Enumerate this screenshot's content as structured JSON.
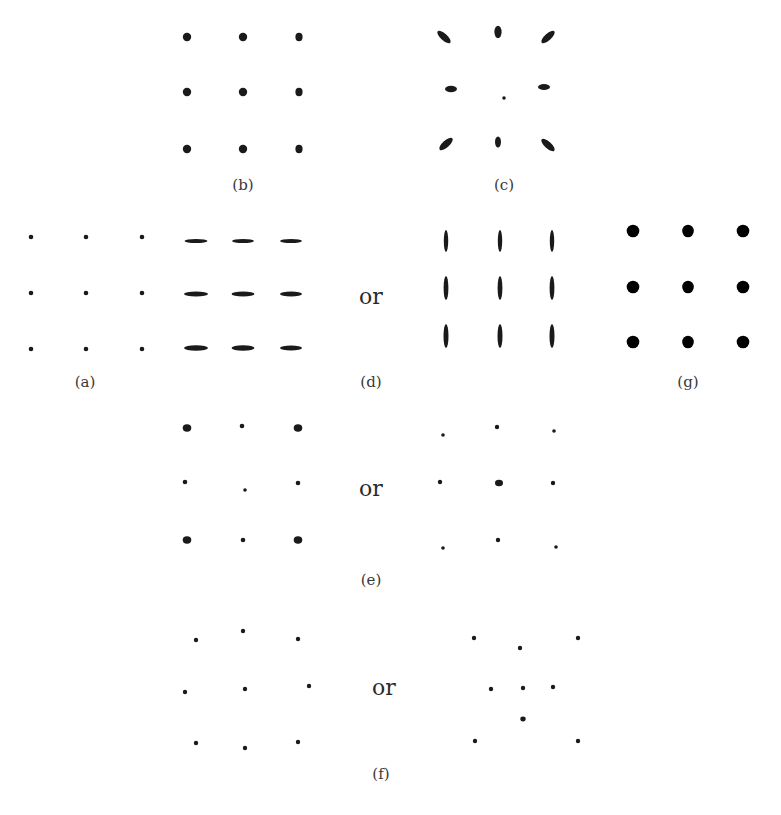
{
  "figure": {
    "ink_color": "#1a1a1a",
    "solid_color": "#000000",
    "label_color": "#3a3a3a",
    "panels": [
      {
        "id": "a",
        "label": "(a)",
        "label_pos": [
          85,
          384
        ],
        "spots": [
          [
            31,
            237,
            2.3,
            2.3,
            0
          ],
          [
            86,
            237,
            2.3,
            2.3,
            0
          ],
          [
            142,
            237,
            2.3,
            2.3,
            0
          ],
          [
            31,
            293,
            2.3,
            2.3,
            0
          ],
          [
            86,
            293,
            2.3,
            2.3,
            0
          ],
          [
            142,
            293,
            2.3,
            2.3,
            0
          ],
          [
            31,
            349,
            2.3,
            2.3,
            0
          ],
          [
            86,
            349,
            2.3,
            2.3,
            0
          ],
          [
            142,
            349,
            2.3,
            2.3,
            0
          ]
        ]
      },
      {
        "id": "b",
        "label": "(b)",
        "label_pos": [
          243,
          187
        ],
        "spots": [
          [
            187,
            37,
            4.2,
            4.2,
            0
          ],
          [
            243,
            37,
            4.2,
            4.2,
            0
          ],
          [
            299,
            37,
            3.6,
            4.2,
            0
          ],
          [
            187,
            92,
            4.2,
            4.2,
            0
          ],
          [
            243,
            92,
            4.2,
            4.2,
            0
          ],
          [
            299,
            92,
            3.6,
            4.2,
            0
          ],
          [
            187,
            149,
            4.2,
            4.2,
            0
          ],
          [
            243,
            149,
            4.2,
            4.2,
            0
          ],
          [
            299,
            149,
            3.6,
            4.2,
            0
          ]
        ]
      },
      {
        "id": "c",
        "label": "(c)",
        "label_pos": [
          504,
          187
        ],
        "spots": [
          [
            444,
            37,
            8.5,
            3.3,
            42
          ],
          [
            498,
            32,
            3.6,
            6.2,
            0
          ],
          [
            548,
            37,
            8.5,
            3.3,
            -42
          ],
          [
            451,
            89,
            6,
            3.3,
            0
          ],
          [
            504,
            98,
            1.8,
            1.8,
            0
          ],
          [
            544,
            87,
            6,
            3,
            0
          ],
          [
            446,
            144,
            8.5,
            3.5,
            -42
          ],
          [
            498,
            142,
            3,
            5.5,
            0
          ],
          [
            548,
            145,
            8.5,
            3.3,
            42
          ]
        ]
      },
      {
        "id": "d",
        "label": "(d)",
        "label_pos": [
          371,
          384
        ],
        "spots": [
          [
            196,
            241,
            11.5,
            2,
            0
          ],
          [
            243,
            241,
            11,
            2,
            0
          ],
          [
            291,
            241,
            11,
            2,
            0
          ],
          [
            196,
            294,
            12,
            2.6,
            0
          ],
          [
            243,
            294,
            11.5,
            2.6,
            0
          ],
          [
            291,
            294,
            11,
            2.5,
            0
          ],
          [
            196,
            348,
            12,
            2.8,
            0
          ],
          [
            243,
            348,
            11.5,
            2.8,
            0
          ],
          [
            291,
            348,
            11,
            2.5,
            0
          ],
          [
            446,
            241,
            2.2,
            11,
            0
          ],
          [
            500,
            241,
            2.2,
            11,
            0
          ],
          [
            552,
            241,
            2.2,
            11,
            0
          ],
          [
            446,
            288,
            2.4,
            12,
            0
          ],
          [
            500,
            288,
            2.4,
            12,
            0
          ],
          [
            552,
            288,
            2.4,
            12,
            0
          ],
          [
            446,
            336,
            2.5,
            12,
            0
          ],
          [
            500,
            336,
            2.5,
            12,
            0
          ],
          [
            552,
            336,
            2.5,
            12,
            0
          ]
        ],
        "or_pos": [
          371,
          300
        ]
      },
      {
        "id": "e",
        "label": "(e)",
        "label_pos": [
          371,
          582
        ],
        "spots": [
          [
            187,
            428,
            4.3,
            3.7,
            0
          ],
          [
            242,
            426,
            2.3,
            2.3,
            0
          ],
          [
            298,
            428,
            4.3,
            3.7,
            0
          ],
          [
            185,
            482,
            2.3,
            2.3,
            0
          ],
          [
            245,
            490,
            1.8,
            1.8,
            0
          ],
          [
            298,
            483,
            2.3,
            2.3,
            0
          ],
          [
            187,
            540,
            4.3,
            3.7,
            0
          ],
          [
            243,
            540,
            2.3,
            2.3,
            0
          ],
          [
            298,
            540,
            4.3,
            3.7,
            0
          ],
          [
            443,
            435,
            1.8,
            1.8,
            0
          ],
          [
            497,
            427,
            2.2,
            2.2,
            0
          ],
          [
            554,
            431,
            1.8,
            1.8,
            0
          ],
          [
            440,
            482,
            2.2,
            2.2,
            0
          ],
          [
            499,
            483,
            4,
            3.3,
            0
          ],
          [
            553,
            483,
            2.2,
            2.2,
            0
          ],
          [
            443,
            548,
            1.8,
            1.8,
            0
          ],
          [
            498,
            540,
            2.2,
            2.2,
            0
          ],
          [
            556,
            547,
            1.8,
            1.8,
            0
          ]
        ],
        "or_pos": [
          371,
          492
        ]
      },
      {
        "id": "f",
        "label": "(f)",
        "label_pos": [
          381,
          776
        ],
        "spots": [
          [
            196,
            640,
            2.2,
            2.2,
            0
          ],
          [
            243,
            631,
            2.2,
            2.2,
            0
          ],
          [
            298,
            639,
            2.2,
            2.2,
            0
          ],
          [
            185,
            692,
            2.2,
            2.2,
            0
          ],
          [
            245,
            689,
            2.2,
            2.2,
            0
          ],
          [
            309,
            686,
            2.2,
            2.2,
            0
          ],
          [
            196,
            743,
            2.2,
            2.2,
            0
          ],
          [
            245,
            748,
            2.2,
            2.2,
            0
          ],
          [
            298,
            742,
            2.2,
            2.2,
            0
          ],
          [
            474,
            638,
            2.2,
            2.2,
            0
          ],
          [
            520,
            648,
            2.2,
            2.2,
            0
          ],
          [
            578,
            638,
            2.2,
            2.2,
            0
          ],
          [
            491,
            689,
            2.2,
            2.2,
            0
          ],
          [
            523,
            688,
            2.2,
            2.2,
            0
          ],
          [
            553,
            687,
            2.2,
            2.2,
            0
          ],
          [
            523,
            719,
            2.7,
            2.4,
            0
          ],
          [
            475,
            741,
            2.2,
            2.2,
            0
          ],
          [
            578,
            741,
            2.2,
            2.2,
            0
          ]
        ],
        "or_pos": [
          384,
          691
        ]
      },
      {
        "id": "g",
        "label": "(g)",
        "label_pos": [
          688,
          384
        ],
        "solid": true,
        "spots": [
          [
            633,
            231,
            6.3,
            6.3,
            0
          ],
          [
            688,
            231,
            5.8,
            6.3,
            0
          ],
          [
            743,
            231,
            6.3,
            6.3,
            0
          ],
          [
            633,
            287,
            6.3,
            6.3,
            0
          ],
          [
            688,
            287,
            5.8,
            6.3,
            0
          ],
          [
            743,
            287,
            6.3,
            6.3,
            0
          ],
          [
            633,
            342,
            6.3,
            6.3,
            0
          ],
          [
            688,
            342,
            5.8,
            6.3,
            0
          ],
          [
            743,
            342,
            6.3,
            6.3,
            0
          ]
        ]
      }
    ],
    "or_word": "or"
  }
}
